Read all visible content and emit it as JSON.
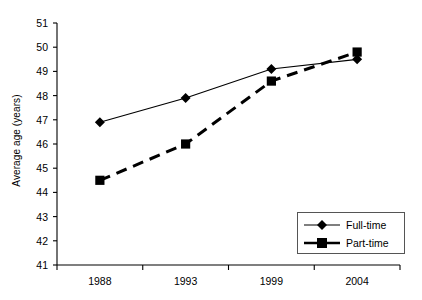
{
  "chart_data": {
    "type": "line",
    "title": "",
    "xlabel": "",
    "ylabel": "Average age (years)",
    "categories": [
      "1988",
      "1993",
      "1999",
      "2004"
    ],
    "ylim": [
      41,
      51
    ],
    "yticks": [
      41,
      42,
      43,
      44,
      45,
      46,
      47,
      48,
      49,
      50,
      51
    ],
    "ytick_labels": [
      "41",
      "42",
      "43",
      "44",
      "45",
      "46",
      "47",
      "48",
      "49",
      "50",
      "51"
    ],
    "grid": false,
    "legend_position": "bottom-right",
    "series": [
      {
        "name": "Full-time",
        "marker": "diamond",
        "linestyle": "solid",
        "color": "#000000",
        "values": [
          46.9,
          47.9,
          49.1,
          49.5
        ]
      },
      {
        "name": "Part-time",
        "marker": "square",
        "linestyle": "dashed",
        "color": "#000000",
        "values": [
          44.5,
          46.0,
          48.6,
          49.8
        ]
      }
    ]
  },
  "legend": {
    "entries": [
      {
        "label": "Full-time"
      },
      {
        "label": "Part-time"
      }
    ]
  },
  "axis": {
    "y_title": "Average age (years)"
  }
}
